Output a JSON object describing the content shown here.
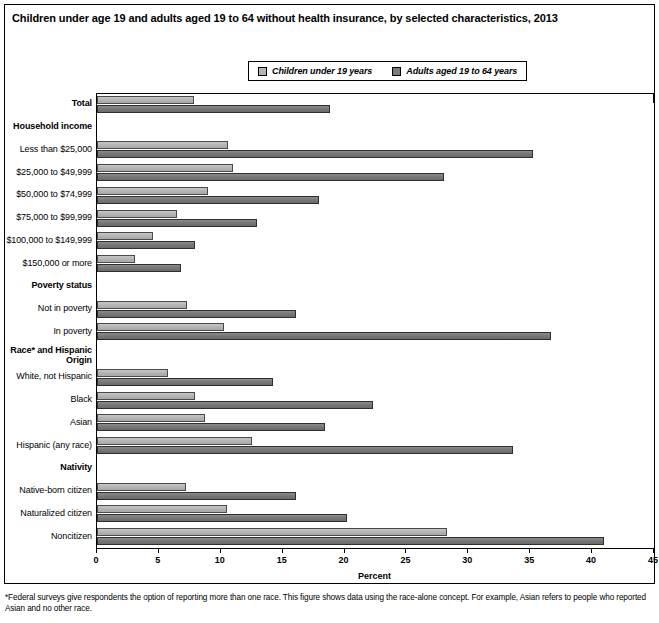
{
  "title": "Children under age 19 and adults aged 19 to 64 without health insurance, by selected characteristics, 2013",
  "footnote": "*Federal surveys give respondents the option of reporting more than one race. This figure shows data using the race-alone concept. For example, Asian refers to people who reported Asian and no other race.",
  "legend": {
    "children_label": "Children under 19 years",
    "adults_label": "Adults aged 19 to 64 years",
    "children_color": "#b4b4b4",
    "adults_color": "#7a7a7a"
  },
  "chart_data": {
    "type": "bar",
    "orientation": "horizontal",
    "title": "Children under age 19 and adults aged 19 to 64 without health insurance, by selected characteristics, 2013",
    "xlabel": "Percent",
    "ylabel": "",
    "xlim": [
      0,
      45
    ],
    "xticks": [
      0,
      5,
      10,
      15,
      20,
      25,
      30,
      35,
      40,
      45
    ],
    "grid": false,
    "legend_position": "top-center",
    "categories": [
      "Total",
      "Household income",
      "Less than $25,000",
      "$25,000 to $49,999",
      "$50,000 to $74,999",
      "$75,000 to $99,999",
      "$100,000 to $149,999",
      "$150,000 or more",
      "Poverty status",
      "Not in poverty",
      "In poverty",
      "Race* and Hispanic Origin",
      "White, not Hispanic",
      "Black",
      "Asian",
      "Hispanic (any race)",
      "Nativity",
      "Native-born citizen",
      "Naturalized citizen",
      "Noncitizen"
    ],
    "group_headers": [
      "Household income",
      "Poverty status",
      "Race* and Hispanic Origin",
      "Nativity"
    ],
    "series": [
      {
        "name": "Children under 19 years",
        "color": "#b4b4b4",
        "values": [
          7.8,
          null,
          10.6,
          11.0,
          9.0,
          6.5,
          4.5,
          3.1,
          null,
          7.3,
          10.3,
          null,
          5.7,
          7.9,
          8.7,
          12.5,
          null,
          7.2,
          10.5,
          28.3
        ]
      },
      {
        "name": "Adults aged 19 to 64 years",
        "color": "#7a7a7a",
        "values": [
          18.8,
          null,
          35.2,
          28.0,
          17.9,
          12.9,
          7.9,
          6.8,
          null,
          16.1,
          36.7,
          null,
          14.2,
          22.3,
          18.4,
          33.6,
          null,
          16.1,
          20.2,
          41.0
        ]
      }
    ]
  },
  "rows": [
    {
      "label": "Total",
      "header": true,
      "children": 7.8,
      "adults": 18.8
    },
    {
      "label": "Household income",
      "header": true,
      "children": null,
      "adults": null
    },
    {
      "label": "Less than $25,000",
      "header": false,
      "children": 10.6,
      "adults": 35.2
    },
    {
      "label": "$25,000 to $49,999",
      "header": false,
      "children": 11.0,
      "adults": 28.0
    },
    {
      "label": "$50,000 to $74,999",
      "header": false,
      "children": 9.0,
      "adults": 17.9
    },
    {
      "label": "$75,000 to $99,999",
      "header": false,
      "children": 6.5,
      "adults": 12.9
    },
    {
      "label": "$100,000 to $149,999",
      "header": false,
      "children": 4.5,
      "adults": 7.9
    },
    {
      "label": "$150,000 or more",
      "header": false,
      "children": 3.1,
      "adults": 6.8
    },
    {
      "label": "Poverty status",
      "header": true,
      "children": null,
      "adults": null
    },
    {
      "label": "Not in poverty",
      "header": false,
      "children": 7.3,
      "adults": 16.1
    },
    {
      "label": "In poverty",
      "header": false,
      "children": 10.3,
      "adults": 36.7
    },
    {
      "label": "Race* and Hispanic\nOrigin",
      "header": true,
      "children": null,
      "adults": null
    },
    {
      "label": "White, not Hispanic",
      "header": false,
      "children": 5.7,
      "adults": 14.2
    },
    {
      "label": "Black",
      "header": false,
      "children": 7.9,
      "adults": 22.3
    },
    {
      "label": "Asian",
      "header": false,
      "children": 8.7,
      "adults": 18.4
    },
    {
      "label": "Hispanic (any race)",
      "header": false,
      "children": 12.5,
      "adults": 33.6
    },
    {
      "label": "Nativity",
      "header": true,
      "children": null,
      "adults": null
    },
    {
      "label": "Native-born citizen",
      "header": false,
      "children": 7.2,
      "adults": 16.1
    },
    {
      "label": "Naturalized citizen",
      "header": false,
      "children": 10.5,
      "adults": 20.2
    },
    {
      "label": "Noncitizen",
      "header": false,
      "children": 28.3,
      "adults": 41.0
    }
  ]
}
